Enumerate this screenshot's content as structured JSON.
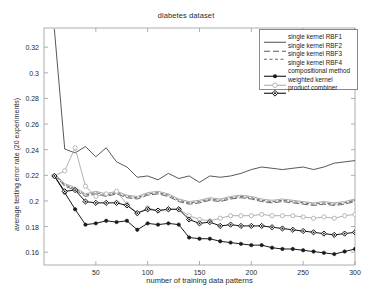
{
  "chart_data": {
    "type": "line",
    "title": "diabetes dataset",
    "xlabel": "number of training data patterns",
    "ylabel": "average testing error rate (20 experiments)",
    "xlim": [
      0,
      300
    ],
    "ylim": [
      0.15,
      0.335
    ],
    "xticks": [
      50,
      100,
      150,
      200,
      250,
      300
    ],
    "xtick_labels": [
      "50",
      "100",
      "150",
      "200",
      "250",
      "300"
    ],
    "yticks": [
      0.16,
      0.18,
      0.2,
      0.22,
      0.24,
      0.26,
      0.28,
      0.3,
      0.32
    ],
    "ytick_labels": [
      "0.16",
      "0.18",
      "0.2",
      "0.22",
      "0.24",
      "0.26",
      "0.28",
      "0.3",
      "0.32"
    ],
    "grid": false,
    "legend_position": "top-right",
    "x": [
      10,
      20,
      30,
      40,
      50,
      60,
      70,
      80,
      90,
      100,
      110,
      120,
      130,
      140,
      150,
      160,
      170,
      180,
      190,
      200,
      210,
      220,
      230,
      240,
      250,
      260,
      270,
      280,
      290,
      300
    ],
    "series": [
      {
        "name": "single kernel RBF1",
        "color": "#3a3a3a",
        "linestyle": "solid",
        "marker": "none",
        "values": [
          0.334,
          0.2405,
          0.2375,
          0.2425,
          0.2345,
          0.2415,
          0.2305,
          0.2265,
          0.2185,
          0.2195,
          0.2165,
          0.2215,
          0.2175,
          0.2195,
          0.2145,
          0.2195,
          0.2185,
          0.2195,
          0.2215,
          0.2245,
          0.2265,
          0.2255,
          0.2245,
          0.2255,
          0.2265,
          0.2245,
          0.2265,
          0.2295,
          0.2305,
          0.2315
        ]
      },
      {
        "name": "single kernel RBF2",
        "color": "#4a4a4a",
        "linestyle": "dashed-long",
        "marker": "none",
        "values": [
          0.2205,
          0.2115,
          0.2085,
          0.2035,
          0.2055,
          0.2035,
          0.2055,
          0.2025,
          0.2015,
          0.2045,
          0.2055,
          0.2035,
          0.1995,
          0.1975,
          0.1985,
          0.2005,
          0.1995,
          0.2015,
          0.2025,
          0.2015,
          0.1995,
          0.1985,
          0.1995,
          0.1985,
          0.1975,
          0.1965,
          0.1975,
          0.1965,
          0.1975,
          0.1995
        ]
      },
      {
        "name": "single kernel RBF3",
        "color": "#555555",
        "linestyle": "dashed-short",
        "marker": "none",
        "values": [
          0.2205,
          0.2125,
          0.2095,
          0.2045,
          0.2065,
          0.2045,
          0.2065,
          0.2035,
          0.2025,
          0.2055,
          0.2065,
          0.2045,
          0.2005,
          0.1985,
          0.1995,
          0.2015,
          0.2005,
          0.2025,
          0.2035,
          0.2025,
          0.2005,
          0.1995,
          0.2005,
          0.1995,
          0.1985,
          0.1975,
          0.1985,
          0.1975,
          0.1985,
          0.2005
        ]
      },
      {
        "name": "single kernel RBF4",
        "color": "#9a9a9a",
        "linestyle": "solid",
        "marker": "none",
        "values": [
          0.2215,
          0.2135,
          0.2105,
          0.2055,
          0.2075,
          0.2055,
          0.2075,
          0.2045,
          0.2035,
          0.2065,
          0.2075,
          0.2055,
          0.2015,
          0.1995,
          0.2005,
          0.2025,
          0.2015,
          0.2035,
          0.2045,
          0.2035,
          0.2015,
          0.2005,
          0.2015,
          0.2005,
          0.1995,
          0.1985,
          0.1995,
          0.1985,
          0.1995,
          0.2015
        ]
      },
      {
        "name": "compositional method",
        "color": "#1a1a1a",
        "linestyle": "solid",
        "marker": "filled-circle",
        "values": [
          0.2195,
          0.2065,
          0.1935,
          0.1815,
          0.1825,
          0.1845,
          0.1835,
          0.1845,
          0.1775,
          0.1825,
          0.1815,
          0.1825,
          0.1815,
          0.1715,
          0.1705,
          0.1705,
          0.1685,
          0.1675,
          0.1665,
          0.1655,
          0.1655,
          0.1635,
          0.1625,
          0.1625,
          0.1615,
          0.1605,
          0.1595,
          0.1585,
          0.1605,
          0.1625
        ]
      },
      {
        "name": "weighted kernel",
        "color": "#b0b0b0",
        "linestyle": "solid",
        "marker": "open-circle",
        "values": [
          0.2195,
          0.2235,
          0.2415,
          0.2115,
          0.2035,
          0.2055,
          0.2075,
          0.1975,
          0.1905,
          0.1945,
          0.1925,
          0.1935,
          0.1935,
          0.1885,
          0.1855,
          0.1845,
          0.1865,
          0.1885,
          0.1885,
          0.1885,
          0.1895,
          0.1885,
          0.1885,
          0.1885,
          0.1875,
          0.1865,
          0.1875,
          0.1865,
          0.1885,
          0.1895
        ]
      },
      {
        "name": "product combiner",
        "color": "#111111",
        "linestyle": "solid",
        "marker": "diamond",
        "values": [
          0.2195,
          0.2075,
          0.2085,
          0.1995,
          0.1985,
          0.1985,
          0.1985,
          0.1965,
          0.1905,
          0.1935,
          0.1925,
          0.1935,
          0.1935,
          0.1855,
          0.1825,
          0.1835,
          0.1805,
          0.1815,
          0.1805,
          0.1805,
          0.1805,
          0.1795,
          0.1785,
          0.1775,
          0.1765,
          0.1755,
          0.1745,
          0.1735,
          0.1745,
          0.1755
        ]
      }
    ]
  },
  "legend": {
    "items": [
      {
        "label": "single kernel RBF1"
      },
      {
        "label": "single kernel RBF2"
      },
      {
        "label": "single kernel RBF3"
      },
      {
        "label": "single kernel RBF4"
      },
      {
        "label": "compositional method"
      },
      {
        "label": "weighted kernel"
      },
      {
        "label": "product combiner"
      }
    ]
  }
}
